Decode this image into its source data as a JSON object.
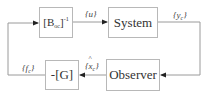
{
  "diagram": {
    "type": "block-diagram",
    "blocks": [
      {
        "id": "inverse_boc",
        "label_main": "[B",
        "label_sub": "oc",
        "label_close": "]",
        "label_sup": "-1"
      },
      {
        "id": "system",
        "label": "System"
      },
      {
        "id": "observer",
        "label": "Observer"
      },
      {
        "id": "gain",
        "label": "-[G]"
      }
    ],
    "signals": {
      "u": {
        "open": "{",
        "sym": "u",
        "close": "}"
      },
      "yc": {
        "open": "{",
        "sym": "y",
        "sub": "c",
        "close": "}"
      },
      "xc_hat": {
        "open": "{",
        "sym": "x",
        "sub": "c",
        "close": "}"
      },
      "fc": {
        "open": "{",
        "sym": "f",
        "sub": "c",
        "close": "}"
      }
    },
    "edges": [
      {
        "from": "inverse_boc",
        "to": "system",
        "signal": "{u}"
      },
      {
        "from": "system",
        "to": "observer",
        "signal": "{y_c}"
      },
      {
        "from": "observer",
        "to": "gain",
        "signal": "{x̂_c}"
      },
      {
        "from": "gain",
        "to": "inverse_boc",
        "signal": "{f_c}"
      }
    ],
    "colors": {
      "line": "#9a9a9a",
      "box_border": "#b8b8b8",
      "arrow": "#222222"
    }
  }
}
